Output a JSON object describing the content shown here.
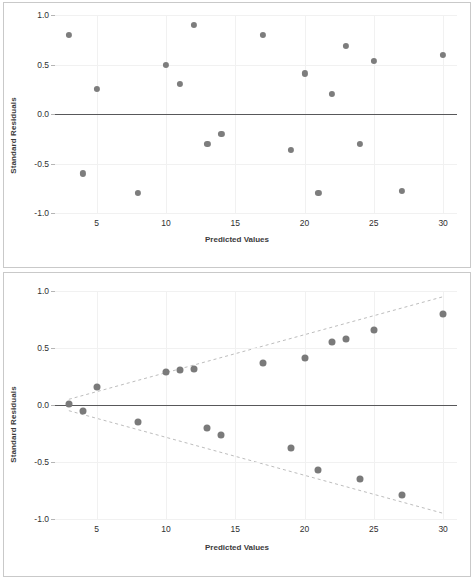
{
  "figure": {
    "background": "#ffffff",
    "marker_color": "#7d7d7d",
    "grid_color": "#f1f1f1",
    "zero_line_color": "#58585a",
    "band_color": "#bdbdbd",
    "border_color": "#c9c9c9"
  },
  "panels": [
    {
      "id": "top",
      "name": "residual-plot-random-scatter"
    },
    {
      "id": "bottom",
      "name": "residual-plot-funnel-pattern"
    }
  ],
  "chart_data": [
    {
      "type": "scatter",
      "panel": "top",
      "title": "",
      "xlabel": "Predicted Values",
      "ylabel": "Standard Residuals",
      "xlim": [
        2,
        31
      ],
      "ylim": [
        -1.0,
        1.0
      ],
      "xticks": [
        5,
        10,
        15,
        20,
        25,
        30
      ],
      "xtick_labels": [
        "5",
        "10",
        "15",
        "20",
        "25",
        "30"
      ],
      "yticks": [
        -1.0,
        -0.5,
        0.0,
        0.5,
        1.0
      ],
      "ytick_labels": [
        "-1.0",
        "-0.5",
        "0.0",
        "0.5",
        "1.0"
      ],
      "grid": true,
      "legend": "none",
      "reference_lines": [
        {
          "kind": "horizontal",
          "y": 0.0,
          "style": "solid"
        }
      ],
      "points": [
        {
          "x": 3,
          "y": 0.8
        },
        {
          "x": 4,
          "y": -0.6
        },
        {
          "x": 5,
          "y": 0.25
        },
        {
          "x": 8,
          "y": -0.8
        },
        {
          "x": 10,
          "y": 0.5
        },
        {
          "x": 11,
          "y": 0.3
        },
        {
          "x": 12,
          "y": 0.9
        },
        {
          "x": 13,
          "y": -0.3
        },
        {
          "x": 14,
          "y": -0.2
        },
        {
          "x": 17,
          "y": 0.8
        },
        {
          "x": 19,
          "y": -0.36
        },
        {
          "x": 20,
          "y": 0.41
        },
        {
          "x": 21,
          "y": -0.8
        },
        {
          "x": 22,
          "y": 0.2
        },
        {
          "x": 23,
          "y": 0.69
        },
        {
          "x": 24,
          "y": -0.3
        },
        {
          "x": 25,
          "y": 0.54
        },
        {
          "x": 27,
          "y": -0.78
        },
        {
          "x": 30,
          "y": 0.6
        }
      ]
    },
    {
      "type": "scatter",
      "panel": "bottom",
      "title": "",
      "xlabel": "Predicted Values",
      "ylabel": "Standard Residuals",
      "xlim": [
        2,
        31
      ],
      "ylim": [
        -1.0,
        1.0
      ],
      "xticks": [
        5,
        10,
        15,
        20,
        25,
        30
      ],
      "xtick_labels": [
        "5",
        "10",
        "15",
        "20",
        "25",
        "30"
      ],
      "yticks": [
        -1.0,
        -0.5,
        0.0,
        0.5,
        1.0
      ],
      "ytick_labels": [
        "-1.0",
        "-0.5",
        "0.0",
        "0.5",
        "1.0"
      ],
      "grid": true,
      "legend": "none",
      "reference_lines": [
        {
          "kind": "horizontal",
          "y": 0.0,
          "style": "solid"
        }
      ],
      "envelope": {
        "style": "dashed",
        "upper": [
          {
            "x": 3,
            "y": 0.05
          },
          {
            "x": 30,
            "y": 0.95
          }
        ],
        "lower": [
          {
            "x": 3,
            "y": -0.05
          },
          {
            "x": 30,
            "y": -0.95
          }
        ]
      },
      "points": [
        {
          "x": 3,
          "y": 0.01
        },
        {
          "x": 4,
          "y": -0.05
        },
        {
          "x": 5,
          "y": 0.16
        },
        {
          "x": 8,
          "y": -0.15
        },
        {
          "x": 10,
          "y": 0.29
        },
        {
          "x": 11,
          "y": 0.31
        },
        {
          "x": 12,
          "y": 0.32
        },
        {
          "x": 13,
          "y": -0.2
        },
        {
          "x": 14,
          "y": -0.26
        },
        {
          "x": 17,
          "y": 0.37
        },
        {
          "x": 19,
          "y": -0.38
        },
        {
          "x": 20,
          "y": 0.41
        },
        {
          "x": 21,
          "y": -0.57
        },
        {
          "x": 22,
          "y": 0.55
        },
        {
          "x": 23,
          "y": 0.58
        },
        {
          "x": 24,
          "y": -0.65
        },
        {
          "x": 25,
          "y": 0.66
        },
        {
          "x": 27,
          "y": -0.79
        },
        {
          "x": 30,
          "y": 0.8
        }
      ]
    }
  ]
}
